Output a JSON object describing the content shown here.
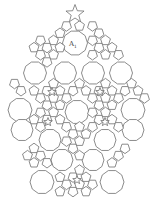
{
  "figure": {
    "label": {
      "main": "A",
      "subscript": "1"
    },
    "line_color": "#6e6e6e",
    "background": "#ffffff",
    "tile_types": [
      "pentagon",
      "decagon",
      "pentagram"
    ]
  }
}
